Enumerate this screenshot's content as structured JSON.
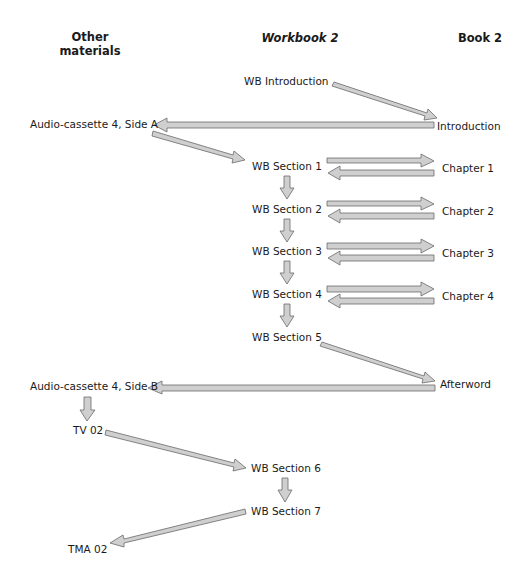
{
  "columns": {
    "other": "Other\nmaterials",
    "other_line1": "Other",
    "other_line2": "materials",
    "workbook": "Workbook 2",
    "book": "Book 2"
  },
  "nodes": {
    "wb_intro": "WB Introduction",
    "introduction": "Introduction",
    "audio_a": "Audio-cassette 4, Side A",
    "wb_s1": "WB Section 1",
    "wb_s2": "WB Section 2",
    "wb_s3": "WB Section 3",
    "wb_s4": "WB Section 4",
    "wb_s5": "WB Section 5",
    "ch1": "Chapter 1",
    "ch2": "Chapter 2",
    "ch3": "Chapter 3",
    "ch4": "Chapter 4",
    "afterword": "Afterword",
    "audio_b": "Audio-cassette 4, Side B",
    "tv02": "TV 02",
    "wb_s6": "WB Section 6",
    "wb_s7": "WB Section 7",
    "tma02": "TMA 02"
  },
  "edges": [
    {
      "from": "WB Introduction",
      "to": "Introduction"
    },
    {
      "from": "Introduction",
      "to": "Audio-cassette 4, Side A"
    },
    {
      "from": "Audio-cassette 4, Side A",
      "to": "WB Section 1"
    },
    {
      "from": "WB Section 1",
      "to": "Chapter 1",
      "bidirectional": true
    },
    {
      "from": "WB Section 1",
      "to": "WB Section 2"
    },
    {
      "from": "WB Section 2",
      "to": "Chapter 2",
      "bidirectional": true
    },
    {
      "from": "WB Section 2",
      "to": "WB Section 3"
    },
    {
      "from": "WB Section 3",
      "to": "Chapter 3",
      "bidirectional": true
    },
    {
      "from": "WB Section 3",
      "to": "WB Section 4"
    },
    {
      "from": "WB Section 4",
      "to": "Chapter 4",
      "bidirectional": true
    },
    {
      "from": "WB Section 4",
      "to": "WB Section 5"
    },
    {
      "from": "WB Section 5",
      "to": "Afterword"
    },
    {
      "from": "Afterword",
      "to": "Audio-cassette 4, Side B"
    },
    {
      "from": "Audio-cassette 4, Side B",
      "to": "TV 02"
    },
    {
      "from": "TV 02",
      "to": "WB Section 6"
    },
    {
      "from": "WB Section 6",
      "to": "WB Section 7"
    },
    {
      "from": "WB Section 7",
      "to": "TMA 02"
    }
  ],
  "colors": {
    "arrow_fill": "#cfcfcf",
    "arrow_stroke": "#6a6a6a",
    "text": "#1a1a1a"
  }
}
